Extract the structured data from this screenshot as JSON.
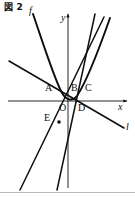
{
  "figure": {
    "caption": "図 2",
    "background_color": "#ffffff",
    "ink_color": "#0d0d0d",
    "width": 135,
    "height": 197
  },
  "axes": {
    "x_label": "x",
    "y_label": "y",
    "origin_label": "O",
    "x_axis": {
      "x1": 8,
      "y1": 101,
      "x2": 127,
      "y2": 101,
      "arrow": "right"
    },
    "y_axis": {
      "x1": 68,
      "y1": 188,
      "x2": 68,
      "y2": 14,
      "arrow": "up"
    },
    "x_label_pos": {
      "x": 118,
      "y": 103
    },
    "y_label_pos": {
      "x": 61,
      "y": 14
    },
    "origin_label_pos": {
      "x": 60,
      "y": 104
    }
  },
  "curves": [
    {
      "name": "parabola-f",
      "label": "f",
      "label_pos": {
        "x": 29,
        "y": 6
      },
      "stroke_width": 1.9,
      "path": "M 33 14 C 44 46 54 78 62 93 C 66 100 72 102 77 96 C 85 84 98 52 110 18",
      "description": "upward parabola with vertex near origin"
    },
    {
      "name": "line-l",
      "label": "l",
      "label_pos": {
        "x": 126,
        "y": 122
      },
      "stroke_width": 1.5,
      "path": "M 9 61 L 124 128",
      "description": "line with negative slope through A and D"
    },
    {
      "name": "line-steep-through-E",
      "label": "",
      "label_pos": null,
      "stroke_width": 1.5,
      "path": "M 20 190 L 104 17",
      "description": "steep ascending line through E, B and C"
    },
    {
      "name": "line-steep-right",
      "label": "",
      "label_pos": null,
      "stroke_width": 1.5,
      "path": "M 57 190 L 95 14",
      "description": "second steep ascending line crossing near D"
    }
  ],
  "points": [
    {
      "id": "A",
      "label": "A",
      "x": 52,
      "y": 92,
      "label_pos": {
        "x": 45,
        "y": 84
      },
      "marker": false
    },
    {
      "id": "B",
      "label": "B",
      "x": 76,
      "y": 92,
      "label_pos": {
        "x": 72,
        "y": 84
      },
      "marker": false
    },
    {
      "id": "C",
      "label": "C",
      "x": 88,
      "y": 92,
      "label_pos": {
        "x": 86,
        "y": 84
      },
      "marker": false
    },
    {
      "id": "O",
      "label": "O",
      "x": 68,
      "y": 101,
      "label_pos": {
        "x": 60,
        "y": 104
      },
      "marker": false
    },
    {
      "id": "D",
      "label": "D",
      "x": 79,
      "y": 101,
      "label_pos": {
        "x": 78,
        "y": 104
      },
      "marker": false
    },
    {
      "id": "E",
      "label": "E",
      "x": 58,
      "y": 120,
      "label_pos": {
        "x": 44,
        "y": 114
      },
      "marker": true,
      "marker_pos": {
        "x": 59,
        "y": 122
      }
    }
  ],
  "border": {
    "bottom_rule": {
      "x1": 0,
      "y1": 192,
      "x2": 135,
      "y2": 192,
      "color": "#b9b9b9"
    }
  }
}
